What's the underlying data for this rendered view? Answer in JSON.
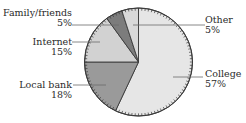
{
  "chart_data": {
    "type": "pie",
    "title": "",
    "start_angle_deg": 0,
    "direction": "clockwise",
    "slices": [
      {
        "label": "College",
        "value": 57,
        "display": "57%",
        "color": "#e6e6e6"
      },
      {
        "label": "Local bank",
        "value": 18,
        "display": "18%",
        "color": "#9a9a9a"
      },
      {
        "label": "Internet",
        "value": 15,
        "display": "15%",
        "color": "#d2d2d2"
      },
      {
        "label": "Family/friends",
        "value": 5,
        "display": "5%",
        "color": "#7c7c7c"
      },
      {
        "label": "Other",
        "value": 5,
        "display": "5%",
        "color": "#d9d9d9"
      }
    ],
    "legend": "none (direct labels with leader lines)"
  },
  "labels": {
    "family": {
      "name": "Family/friends",
      "pct": "5%"
    },
    "internet": {
      "name": "Internet",
      "pct": "15%"
    },
    "bank": {
      "name": "Local bank",
      "pct": "18%"
    },
    "other": {
      "name": "Other",
      "pct": "5%"
    },
    "college": {
      "name": "College",
      "pct": "57%"
    }
  },
  "style": {
    "outline": "#3a3a3a",
    "leader": "#6a6a6a"
  }
}
